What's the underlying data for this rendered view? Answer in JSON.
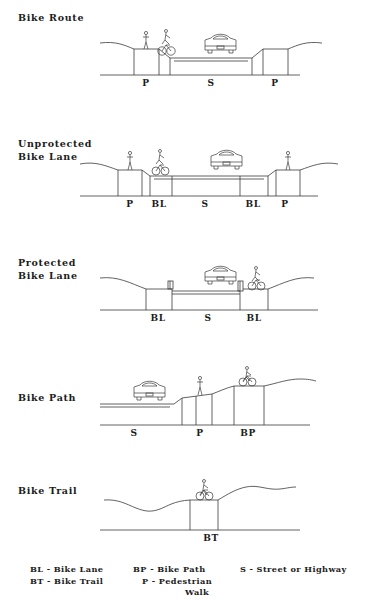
{
  "diagrams": [
    {
      "title": "Bike Route",
      "title_x": 18,
      "title_y": 12,
      "baseline_y": 75,
      "label_y": 78,
      "zones": [
        {
          "label": "P",
          "x": 146
        },
        {
          "label": "S",
          "x": 211
        },
        {
          "label": "P",
          "x": 275
        }
      ]
    },
    {
      "title": "Unprotected\nBike Lane",
      "title_x": 18,
      "title_y": 138,
      "baseline_y": 196,
      "label_y": 199,
      "zones": [
        {
          "label": "P",
          "x": 130
        },
        {
          "label": "BL",
          "x": 159
        },
        {
          "label": "S",
          "x": 205
        },
        {
          "label": "BL",
          "x": 253
        },
        {
          "label": "P",
          "x": 285
        }
      ]
    },
    {
      "title": "Protected\nBike Lane",
      "title_x": 18,
      "title_y": 257,
      "baseline_y": 310,
      "label_y": 313,
      "zones": [
        {
          "label": "BL",
          "x": 158
        },
        {
          "label": "S",
          "x": 208
        },
        {
          "label": "BL",
          "x": 254
        }
      ]
    },
    {
      "title": "Bike Path",
      "title_x": 18,
      "title_y": 392,
      "baseline_y": 425,
      "label_y": 428,
      "zones": [
        {
          "label": "S",
          "x": 134
        },
        {
          "label": "P",
          "x": 200
        },
        {
          "label": "BP",
          "x": 248
        }
      ]
    },
    {
      "title": "Bike Trail",
      "title_x": 18,
      "title_y": 485,
      "baseline_y": 530,
      "label_y": 533,
      "zones": [
        {
          "label": "BT",
          "x": 211
        }
      ]
    }
  ],
  "legend": {
    "column1": [
      "BL - Bike Lane",
      "BT - Bike Trail"
    ],
    "column2": [
      "BP - Bike Path",
      "P - Pedestrian",
      "Walk"
    ],
    "column3": [
      "S - Street or Highway"
    ]
  },
  "icons": {
    "car": "car-front-icon",
    "pedestrian": "pedestrian-icon",
    "cyclist": "cyclist-icon"
  },
  "colors": {
    "ink": "#1c1c1c",
    "line": "#3a3a3a",
    "background": "#ffffff"
  }
}
